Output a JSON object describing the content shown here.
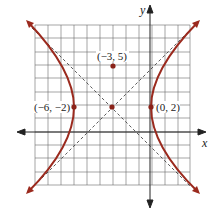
{
  "diagram": {
    "type": "hyperbola-graph",
    "axes": {
      "x_label": "x",
      "y_label": "y"
    },
    "points": [
      {
        "label": "(−3, 5)",
        "role": "focus-or-point"
      },
      {
        "label": "(−6, −2)",
        "role": "vertex-left"
      },
      {
        "label": "(0, 2)",
        "role": "vertex-right"
      },
      {
        "label": "",
        "role": "center"
      }
    ],
    "colors": {
      "curve": "#9b2a1e",
      "grid": "#555555",
      "asymptote": "#333333",
      "background": "#ffffff"
    }
  }
}
